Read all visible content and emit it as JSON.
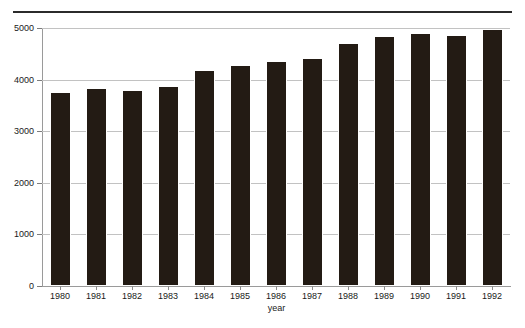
{
  "figure": {
    "top_rule": true,
    "clipped_header_text": ""
  },
  "chart_data": {
    "type": "bar",
    "title": "",
    "xlabel": "year",
    "ylabel": "dollars",
    "categories": [
      "1980",
      "1981",
      "1982",
      "1983",
      "1984",
      "1985",
      "1986",
      "1987",
      "1988",
      "1989",
      "1990",
      "1991",
      "1992"
    ],
    "values": [
      3760,
      3840,
      3800,
      3880,
      4190,
      4280,
      4360,
      4420,
      4700,
      4840,
      4900,
      4860,
      4980
    ],
    "ylim": [
      0,
      5000
    ],
    "yticks": [
      0,
      1000,
      2000,
      3000,
      4000,
      5000
    ],
    "ytick_labels": [
      "0",
      "1000",
      "2000",
      "3000",
      "4000",
      "5000"
    ],
    "grid": true,
    "grid_axis": "y",
    "legend": false,
    "bar_color": "#231b14",
    "gridline_color": "#c2c2c2",
    "axis_color": "#9a9a9a"
  }
}
